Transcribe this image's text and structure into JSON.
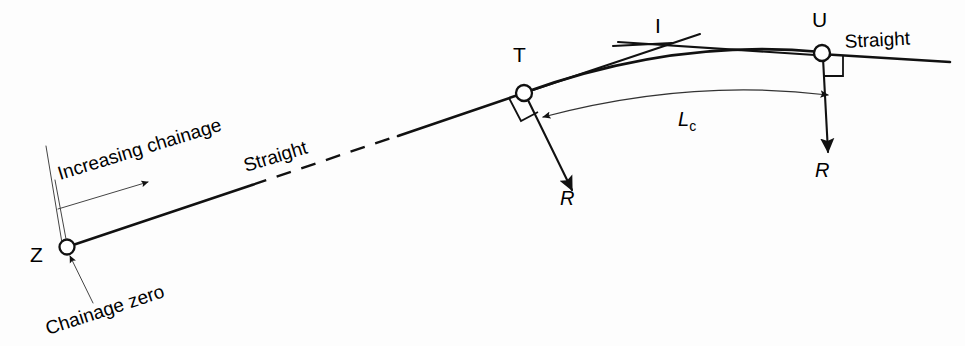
{
  "figure": {
    "kind": "engineering-survey-diagram",
    "background_color": "#fdfdfd",
    "line_color": "#111111"
  },
  "points": [
    {
      "id": "Z",
      "label": "Z",
      "x": 67,
      "y": 247,
      "label_x": 36,
      "label_y": 256,
      "marker": "open-circle"
    },
    {
      "id": "T",
      "label": "T",
      "x": 524,
      "y": 93,
      "label_x": 516,
      "label_y": 62,
      "marker": "open-circle"
    },
    {
      "id": "I",
      "label": "I",
      "x": 661,
      "y": 47,
      "label_x": 655,
      "label_y": 33,
      "marker": "none"
    },
    {
      "id": "U",
      "label": "U",
      "x": 822,
      "y": 53,
      "label_x": 813,
      "label_y": 26,
      "marker": "open-circle"
    }
  ],
  "labels": {
    "increasing_chainage": "Increasing chainage",
    "chainage_zero": "Chainage zero",
    "straight_left": "Straight",
    "straight_right": "Straight",
    "curve_length": "L",
    "curve_length_sub": "c",
    "radius_at_t": "R",
    "radius_at_u": "R"
  },
  "annotations": {
    "increasing_chainage_rotation": -17,
    "chainage_zero_rotation": -18,
    "straight_left_rotation": -17,
    "straight_right_rotation": -3
  },
  "geometry": {
    "back_tangent_start": [
      67,
      247
    ],
    "back_tangent_end": [
      524,
      93
    ],
    "dashed_gap": [
      250,
      400
    ],
    "forward_tangent_end": [
      950,
      60
    ],
    "curve_start": [
      524,
      93
    ],
    "curve_end": [
      822,
      53
    ],
    "radius_arrow_t_end": [
      572,
      188
    ],
    "radius_arrow_u_end": [
      845,
      152
    ]
  }
}
